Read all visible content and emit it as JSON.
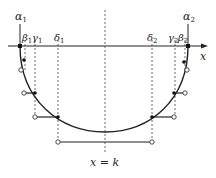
{
  "labels": {
    "alpha1": "α",
    "alpha1_sub": "1",
    "beta1": "β",
    "beta1_sub": "1",
    "gamma1": "γ",
    "gamma1_sub": "1",
    "delta1": "δ",
    "delta1_sub": "1",
    "alpha2": "α",
    "alpha2_sub": "2",
    "beta2": "β",
    "beta2_sub": "2",
    "gamma2": "γ",
    "gamma2_sub": "2",
    "delta2": "δ",
    "delta2_sub": "2",
    "x_axis": "x",
    "center": "x = k"
  },
  "colors": {
    "stroke": "#222222",
    "dashed": "#444444"
  }
}
